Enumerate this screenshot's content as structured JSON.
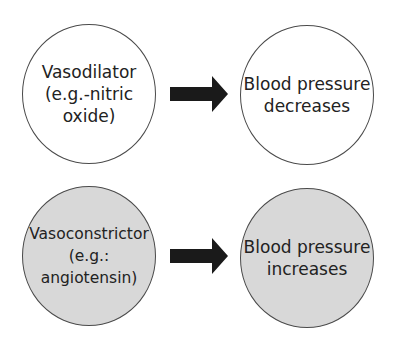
{
  "diagram": {
    "rows": [
      {
        "cause": {
          "label": "Vasodilator\n(e.g.-nitric\noxide)",
          "fill": "#ffffff"
        },
        "arrow": {
          "icon": "right-arrow-icon",
          "color": "#1a1a1a"
        },
        "effect": {
          "label": "Blood pressure\ndecreases",
          "fill": "#ffffff"
        }
      },
      {
        "cause": {
          "label": "Vasoconstrictor\n(e.g.:\nangiotensin)",
          "fill": "#d8d8d8"
        },
        "arrow": {
          "icon": "right-arrow-icon",
          "color": "#1a1a1a"
        },
        "effect": {
          "label": "Blood pressure\nincreases",
          "fill": "#d8d8d8"
        }
      }
    ]
  }
}
